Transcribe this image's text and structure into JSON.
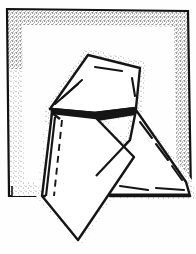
{
  "figure": {
    "kind": "line-drawing",
    "subject": "folded-paper-forms-in-stippled-frame",
    "title": "",
    "caption": "",
    "canvas": {
      "width": 196,
      "height": 254
    },
    "colors": {
      "background": "#fefefe",
      "ink": "#151515",
      "stipple": "#2a2a2a",
      "paper_fill": "#ffffff",
      "frame_stroke": "#111111"
    },
    "frame": {
      "name": "outer-frame",
      "stroke_width": 2.2,
      "corners": [
        [
          7,
          9
        ],
        [
          188,
          11
        ],
        [
          191,
          196
        ],
        [
          9,
          196
        ]
      ],
      "stipple_band_px": 16,
      "stipple_density": "heavy-top-and-left-corners"
    },
    "shapes": [
      {
        "name": "top-pentagon-panel",
        "role": "upper folded sheet",
        "points": [
          [
            88,
            55
          ],
          [
            140,
            68
          ],
          [
            136,
            108
          ],
          [
            94,
            113
          ],
          [
            50,
            109
          ]
        ],
        "stroke_width": 2.4,
        "fill": "#ffffff",
        "highlight_dashes": [
          [
            [
              95,
              67
            ],
            [
              122,
              71
            ]
          ],
          [
            [
              132,
              78
            ],
            [
              135,
              96
            ]
          ],
          [
            [
              62,
              98
            ],
            [
              82,
              80
            ]
          ],
          [
            [
              55,
              104
            ],
            [
              78,
              84
            ]
          ]
        ]
      },
      {
        "name": "left-crease-panel",
        "role": "lower-left folded flap",
        "points": [
          [
            52,
            113
          ],
          [
            96,
            118
          ],
          [
            134,
            157
          ],
          [
            78,
            240
          ],
          [
            42,
            196
          ]
        ],
        "stroke_width": 2.4,
        "fill": "#ffffff",
        "fold_lines": [
          {
            "style": "solid",
            "points": [
              [
                55,
                117
              ],
              [
                46,
                196
              ]
            ]
          },
          {
            "style": "dashed",
            "points": [
              [
                62,
                120
              ],
              [
                54,
                196
              ]
            ]
          }
        ]
      },
      {
        "name": "center-ridge-band",
        "role": "thick crease between panels",
        "points": [
          [
            52,
            109
          ],
          [
            96,
            113
          ],
          [
            136,
            108
          ],
          [
            134,
            114
          ],
          [
            96,
            120
          ],
          [
            52,
            116
          ]
        ],
        "stroke_width": 2.6,
        "fill": "#151515"
      },
      {
        "name": "right-wedge-panel",
        "role": "right triangular flap",
        "points": [
          [
            136,
            110
          ],
          [
            186,
            182
          ],
          [
            190,
            196
          ],
          [
            110,
            196
          ],
          [
            96,
            176
          ],
          [
            130,
            140
          ]
        ],
        "stroke_width": 2.4,
        "fill": "#ffffff",
        "highlight_dashes": [
          [
            [
              140,
              122
            ],
            [
              152,
              138
            ]
          ],
          [
            [
              156,
              144
            ],
            [
              168,
              160
            ]
          ],
          [
            [
              172,
              166
            ],
            [
              182,
              180
            ]
          ],
          [
            [
              120,
              186
            ],
            [
              148,
              190
            ]
          ],
          [
            [
              156,
              188
            ],
            [
              184,
              190
            ]
          ]
        ]
      },
      {
        "name": "lower-left-floor-shadow",
        "role": "stipple shadow under left flap",
        "points": [
          [
            12,
            186
          ],
          [
            46,
            188
          ],
          [
            44,
            196
          ],
          [
            12,
            196
          ]
        ]
      }
    ],
    "annotations": {
      "fold_line_style": "dashed",
      "shading_technique": "stipple",
      "line_style": "hand-drawn ink contour"
    }
  }
}
